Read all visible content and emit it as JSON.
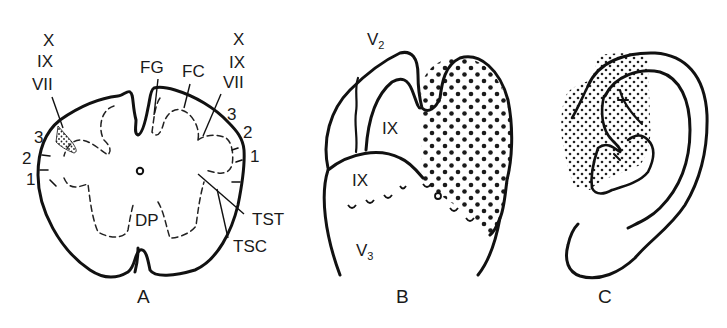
{
  "figure": {
    "panels": [
      {
        "id": "A",
        "label": "A",
        "description": "Cross-section of medulla / spinal cord showing sensory tracts",
        "labels": {
          "left_stack": [
            "X",
            "IX",
            "VII"
          ],
          "right_stack": [
            "X",
            "IX",
            "VII"
          ],
          "left_numbers": [
            "3",
            "2",
            "1"
          ],
          "right_numbers": [
            "3",
            "2",
            "1"
          ],
          "fg": "FG",
          "fc": "FC",
          "dp": "DP",
          "tst": "TST",
          "tsc": "TSC"
        }
      },
      {
        "id": "B",
        "label": "B",
        "description": "Face dermatome outline with stippled region",
        "labels": {
          "v2": "V",
          "v2_sub": "2",
          "ix_upper": "IX",
          "ix_lower": "IX",
          "v3": "V",
          "v3_sub": "3"
        }
      },
      {
        "id": "C",
        "label": "C",
        "description": "External ear with stippled concha region"
      }
    ],
    "colors": {
      "ink": "#111111",
      "background": "#ffffff",
      "stipple": "#222222"
    }
  }
}
